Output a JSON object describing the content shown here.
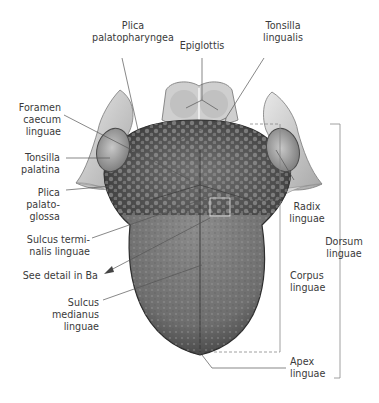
{
  "figure": {
    "labels": {
      "plica_palatopharyngea": "Plica\npalatopharyngea",
      "epiglottis": "Epiglottis",
      "tonsilla_lingualis": "Tonsilla\nlingualis",
      "foramen_caecum": "Foramen\ncaecum\nlinguae",
      "tonsilla_palatina": "Tonsilla\npalatina",
      "plica_palatoglossa": "Plica\npalato-\nglossa",
      "sulcus_terminalis": "Sulcus termi-\nnalis linguae",
      "see_detail": "See detail in Ba",
      "sulcus_medianus": "Sulcus\nmedianus\nlinguae",
      "radix_linguae": "Radix\nlinguae",
      "dorsum_linguae": "Dorsum\nlinguae",
      "corpus_linguae": "Corpus\nlinguae",
      "apex_linguae": "Apex\nlinguae"
    }
  }
}
